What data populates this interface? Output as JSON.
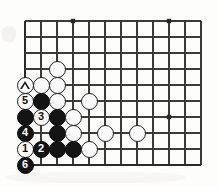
{
  "figure": {
    "kind": "go-board-diagram",
    "background_color": "#fdfdfc",
    "line_color": "#3a3a3a",
    "edge_line_color": "#2a2a2a",
    "black_stone_color": "#141414",
    "white_stone_color": "#fdfdfd"
  },
  "board": {
    "origin_x": 25,
    "origin_y": 21,
    "spacing": 16,
    "columns": 12,
    "rows": 10,
    "left_edge": true,
    "bottom_edge": true,
    "top_edge": false,
    "right_edge": false,
    "stone_diameter": 17
  },
  "star_points": [
    {
      "col": 3,
      "row": 0
    },
    {
      "col": 9,
      "row": 0
    },
    {
      "col": 9,
      "row": 6
    }
  ],
  "stones": [
    {
      "col": 2,
      "row": 3,
      "color": "white",
      "label": "",
      "marker": ""
    },
    {
      "col": 0,
      "row": 4,
      "color": "white",
      "label": "",
      "marker": "triangle"
    },
    {
      "col": 1,
      "row": 4,
      "color": "white",
      "label": "",
      "marker": ""
    },
    {
      "col": 2,
      "row": 4,
      "color": "white",
      "label": "",
      "marker": ""
    },
    {
      "col": 0,
      "row": 5,
      "color": "white",
      "label": "5",
      "marker": ""
    },
    {
      "col": 1,
      "row": 5,
      "color": "black",
      "label": "",
      "marker": ""
    },
    {
      "col": 2,
      "row": 5,
      "color": "white",
      "label": "",
      "marker": ""
    },
    {
      "col": 4,
      "row": 5,
      "color": "white",
      "label": "",
      "marker": ""
    },
    {
      "col": 0,
      "row": 6,
      "color": "black",
      "label": "",
      "marker": ""
    },
    {
      "col": 1,
      "row": 6,
      "color": "white",
      "label": "3",
      "marker": ""
    },
    {
      "col": 2,
      "row": 6,
      "color": "black",
      "label": "",
      "marker": ""
    },
    {
      "col": 3,
      "row": 6,
      "color": "white",
      "label": "",
      "marker": ""
    },
    {
      "col": 0,
      "row": 7,
      "color": "black",
      "label": "4",
      "marker": ""
    },
    {
      "col": 2,
      "row": 7,
      "color": "black",
      "label": "",
      "marker": ""
    },
    {
      "col": 3,
      "row": 7,
      "color": "white",
      "label": "",
      "marker": ""
    },
    {
      "col": 5,
      "row": 7,
      "color": "white",
      "label": "",
      "marker": ""
    },
    {
      "col": 7,
      "row": 7,
      "color": "white",
      "label": "",
      "marker": ""
    },
    {
      "col": 0,
      "row": 8,
      "color": "white",
      "label": "1",
      "marker": ""
    },
    {
      "col": 1,
      "row": 8,
      "color": "black",
      "label": "2",
      "marker": ""
    },
    {
      "col": 2,
      "row": 8,
      "color": "black",
      "label": "",
      "marker": ""
    },
    {
      "col": 3,
      "row": 8,
      "color": "black",
      "label": "",
      "marker": ""
    },
    {
      "col": 4,
      "row": 8,
      "color": "white",
      "label": "",
      "marker": ""
    },
    {
      "col": 0,
      "row": 9,
      "color": "black",
      "label": "6",
      "marker": ""
    }
  ],
  "move_labels": [
    "1",
    "2",
    "3",
    "4",
    "5",
    "6"
  ],
  "markers": [
    "triangle"
  ]
}
